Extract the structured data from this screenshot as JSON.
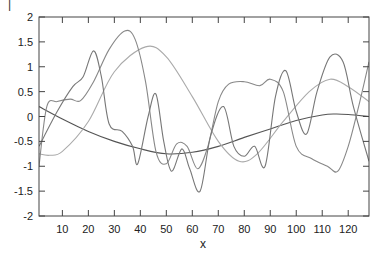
{
  "chart_data": {
    "type": "line",
    "title": "",
    "xlabel": "x",
    "ylabel": "",
    "xlim": [
      1,
      128
    ],
    "ylim": [
      -2,
      2
    ],
    "grid": false,
    "legend": null,
    "x_ticks": [
      10,
      20,
      30,
      40,
      50,
      60,
      70,
      80,
      90,
      100,
      110,
      120
    ],
    "y_ticks": [
      -2,
      -1.5,
      -1,
      -0.5,
      0,
      0.5,
      1,
      1.5,
      2
    ],
    "y_tick_labels": [
      "-2",
      "-1.5",
      "-1",
      "-0.5",
      "0",
      "0.5",
      "1",
      "1.5",
      "2"
    ],
    "series": [
      {
        "name": "series-1",
        "color": "#555555",
        "x": [
          1,
          10,
          20,
          30,
          40,
          50,
          60,
          70,
          80,
          90,
          100,
          110,
          115,
          120,
          128
        ],
        "y": [
          0.2,
          -0.05,
          -0.3,
          -0.5,
          -0.65,
          -0.75,
          -0.72,
          -0.6,
          -0.42,
          -0.25,
          -0.08,
          0.03,
          0.05,
          0.04,
          0.0
        ]
      },
      {
        "name": "series-2",
        "color": "#aaaaaa",
        "x": [
          1,
          5,
          10,
          20,
          30,
          42,
          50,
          60,
          70,
          78,
          85,
          95,
          105,
          113,
          120,
          128
        ],
        "y": [
          -0.75,
          -0.78,
          -0.7,
          -0.1,
          0.9,
          1.4,
          1.2,
          0.4,
          -0.5,
          -0.9,
          -0.75,
          -0.1,
          0.5,
          0.75,
          0.6,
          0.3
        ]
      },
      {
        "name": "series-3",
        "color": "#888888",
        "x": [
          1,
          4,
          8,
          13,
          17,
          22,
          28,
          34,
          38,
          42,
          46,
          50,
          54,
          58,
          62,
          66,
          70,
          74,
          80,
          86,
          90,
          95,
          100,
          106,
          112,
          116,
          120,
          124,
          128
        ],
        "y": [
          -1.0,
          0.2,
          0.3,
          0.35,
          0.32,
          0.7,
          1.35,
          1.72,
          1.55,
          0.7,
          -0.7,
          -0.95,
          -0.55,
          -0.6,
          -1.05,
          -0.6,
          0.3,
          0.65,
          0.7,
          0.62,
          0.75,
          0.5,
          -0.6,
          -0.85,
          -1.0,
          -1.1,
          -0.6,
          0.2,
          1.1
        ]
      },
      {
        "name": "series-4",
        "color": "#777777",
        "x": [
          1,
          8,
          14,
          18,
          22,
          25,
          28,
          33,
          37,
          39,
          43,
          46,
          49,
          52,
          56,
          59,
          63,
          67,
          72,
          76,
          80,
          84,
          88,
          92,
          96,
          100,
          104,
          108,
          113,
          118,
          122,
          128
        ],
        "y": [
          -0.6,
          0.1,
          0.6,
          0.8,
          1.32,
          0.8,
          -0.15,
          -0.3,
          -0.6,
          -0.95,
          0.0,
          0.45,
          -0.5,
          -1.1,
          -0.65,
          -1.05,
          -1.5,
          -0.4,
          0.2,
          -0.6,
          -0.8,
          -0.6,
          -1.0,
          0.4,
          0.92,
          0.1,
          -0.35,
          0.5,
          1.2,
          1.1,
          0.2,
          -0.9
        ]
      }
    ]
  },
  "corner_mark": "|"
}
